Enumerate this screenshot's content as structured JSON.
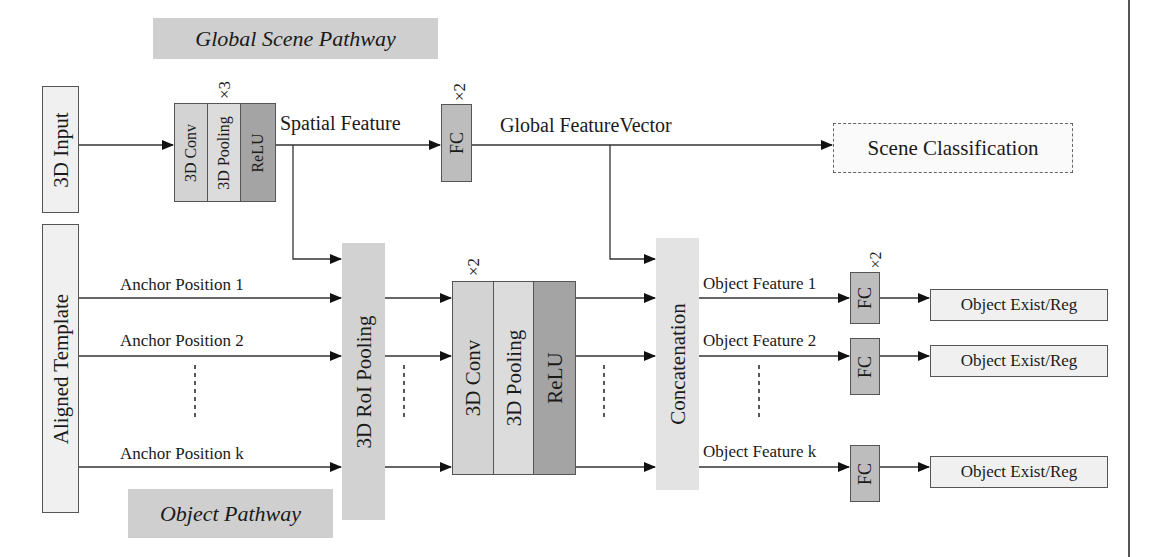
{
  "banners": {
    "global": "Global Scene Pathway",
    "object": "Object Pathway"
  },
  "inputs": {
    "input_3d": "3D Input",
    "aligned_template": "Aligned Template"
  },
  "global_path": {
    "conv": "3D Conv",
    "pool": "3D Pooling",
    "relu": "ReLU",
    "repeat": "×3",
    "spatial_feature": "Spatial Feature",
    "fc": "FC",
    "fc_repeat": "×2",
    "global_feature_vector": "Global FeatureVector",
    "scene_classification": "Scene Classification"
  },
  "object_path": {
    "anchors": [
      "Anchor Position 1",
      "Anchor Position 2",
      "Anchor Position k"
    ],
    "roi_pooling": "3D RoI Pooling",
    "conv": "3D Conv",
    "pool": "3D Pooling",
    "relu": "ReLU",
    "repeat": "×2",
    "concatenation": "Concatenation",
    "features": [
      "Object Feature 1",
      "Object Feature 2",
      "Object Feature k"
    ],
    "fc": "FC",
    "fc_repeat": "×2",
    "outputs": [
      "Object Exist/Reg",
      "Object Exist/Reg",
      "Object Exist/Reg"
    ]
  },
  "colors": {
    "banner": "#cfcfcf",
    "light_box": "#f0f0f0",
    "conv": "#d3d3d3",
    "pool": "#dcdcdc",
    "relu": "#a4a4a4",
    "fc": "#bdbdbd",
    "roi": "#d2d2d2",
    "concat": "#e3e3e3",
    "line": "#333333"
  }
}
